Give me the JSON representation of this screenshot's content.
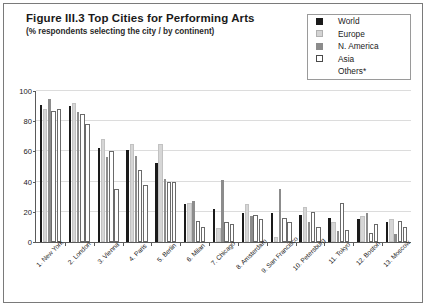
{
  "figure": {
    "title": "Figure III.3  Top Cities for Performing Arts",
    "subtitle": "(% respondents selecting the city / by continent)"
  },
  "legend": {
    "position": "top-right",
    "entries": [
      {
        "label": "World",
        "marker": "filled-square",
        "color": "#1a1a1a"
      },
      {
        "label": "Europe",
        "marker": "filled-square",
        "color": "#d3d3d3"
      },
      {
        "label": "N. America",
        "marker": "filled-square",
        "color": "#8c8c8c"
      },
      {
        "label": "Asia",
        "marker": "hollow-square",
        "color": "#ffffff"
      },
      {
        "label": "Others*",
        "marker": "none",
        "color": "#ffffff"
      }
    ]
  },
  "chart_data": {
    "type": "bar",
    "title": "Figure III.3  Top Cities for Performing Arts",
    "subtitle": "(% respondents selecting the city / by continent)",
    "xlabel": "",
    "ylabel": "",
    "ylim": [
      0,
      100
    ],
    "yticks": [
      0,
      20,
      40,
      60,
      80,
      100
    ],
    "grid": true,
    "legend_position": "top-right",
    "categories": [
      "1. New York",
      "2. London",
      "3. Vienna",
      "4. Paris",
      "5. Berlin",
      "6. Milan",
      "7. Chicago",
      "8. Amsterdam",
      "9. San Francisco",
      "10. Petersburg",
      "11. Tokyo",
      "12. Boston",
      "13. Moscow"
    ],
    "series": [
      {
        "name": "World",
        "color": "#1a1a1a",
        "values": [
          91,
          90,
          62,
          61,
          52,
          25,
          22,
          19,
          19,
          18,
          16,
          15,
          13
        ]
      },
      {
        "name": "Europe",
        "color": "#d3d3d3",
        "values": [
          88,
          92,
          68,
          65,
          65,
          26,
          9,
          25,
          3,
          23,
          13,
          17,
          15
        ]
      },
      {
        "name": "N. America",
        "color": "#8c8c8c",
        "values": [
          95,
          86,
          56,
          57,
          42,
          27,
          41,
          17,
          35,
          13,
          7,
          19,
          5
        ]
      },
      {
        "name": "Asia",
        "color": "#ffffff",
        "values": [
          87,
          85,
          60,
          48,
          40,
          14,
          13,
          18,
          16,
          20,
          26,
          6,
          14
        ]
      },
      {
        "name": "Others*",
        "color": "#ffffff",
        "values": [
          88,
          78,
          35,
          38,
          40,
          10,
          12,
          15,
          13,
          10,
          8,
          12,
          10
        ]
      }
    ]
  }
}
